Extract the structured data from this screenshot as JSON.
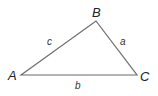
{
  "diagram": {
    "type": "triangle",
    "stroke_color": "#6b6b6b",
    "vertices": [
      {
        "id": "A",
        "label": "A",
        "x": 21,
        "y": 75
      },
      {
        "id": "B",
        "label": "B",
        "x": 96,
        "y": 21
      },
      {
        "id": "C",
        "label": "C",
        "x": 137,
        "y": 75
      }
    ],
    "sides": [
      {
        "id": "a",
        "label": "a",
        "between": [
          "B",
          "C"
        ]
      },
      {
        "id": "b",
        "label": "b",
        "between": [
          "A",
          "C"
        ]
      },
      {
        "id": "c",
        "label": "c",
        "between": [
          "A",
          "B"
        ]
      }
    ]
  }
}
